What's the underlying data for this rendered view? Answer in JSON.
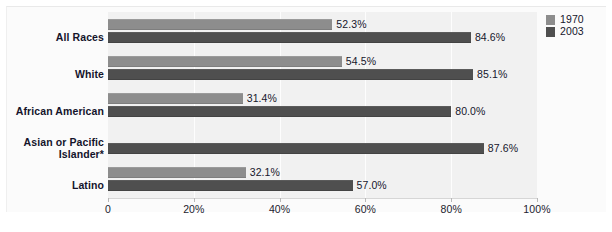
{
  "chart_data": {
    "type": "bar",
    "orientation": "horizontal",
    "title": "",
    "xlabel": "",
    "ylabel": "",
    "xlim": [
      0,
      100
    ],
    "grid": true,
    "legend_position": "top-right",
    "categories": [
      "All Races",
      "White",
      "African American",
      "Asian or Pacific Islander*",
      "Latino"
    ],
    "tick_labels": [
      "0",
      "20%",
      "40%",
      "60%",
      "80%",
      "100%"
    ],
    "tick_values": [
      0,
      20,
      40,
      60,
      80,
      100
    ],
    "series": [
      {
        "name": "1970",
        "color": "#8d8d8d",
        "values": [
          52.3,
          54.5,
          31.4,
          null,
          32.1
        ],
        "labels": [
          "52.3%",
          "54.5%",
          "31.4%",
          "",
          "32.1%"
        ]
      },
      {
        "name": "2003",
        "color": "#4f4f4f",
        "values": [
          84.6,
          85.1,
          80.0,
          87.6,
          57.0
        ],
        "labels": [
          "84.6%",
          "85.1%",
          "80.0%",
          "87.6%",
          "57.0%"
        ]
      }
    ]
  },
  "legend": {
    "items": [
      {
        "label": "1970"
      },
      {
        "label": "2003"
      }
    ]
  },
  "colors": {
    "series_1970": "#8d8d8d",
    "series_2003": "#4f4f4f",
    "plot_background": "#f1f1f1",
    "page_background": "#ffffff",
    "text": "#16162c"
  }
}
